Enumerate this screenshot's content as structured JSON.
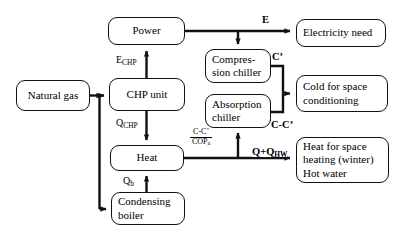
{
  "diagram": {
    "nodes": [
      {
        "id": "natural-gas",
        "label": "Natural gas",
        "x": 16,
        "y": 80,
        "w": 74,
        "h": 31,
        "align": "center"
      },
      {
        "id": "power",
        "label": "Power",
        "x": 108,
        "y": 17,
        "w": 77,
        "h": 28,
        "align": "center"
      },
      {
        "id": "chp-unit",
        "label": "CHP unit",
        "x": 109,
        "y": 78,
        "w": 76,
        "h": 33,
        "align": "center"
      },
      {
        "id": "heat",
        "label": "Heat",
        "x": 110,
        "y": 145,
        "w": 74,
        "h": 26,
        "align": "center"
      },
      {
        "id": "condensing-boiler",
        "label": "Condensing boiler",
        "x": 111,
        "y": 192,
        "w": 74,
        "h": 33,
        "align": "left"
      },
      {
        "id": "compression-chiller",
        "label": "Compres-sion chiller",
        "x": 205,
        "y": 49,
        "w": 66,
        "h": 34,
        "align": "left"
      },
      {
        "id": "absorption-chiller",
        "label": "Absorption chiller",
        "x": 205,
        "y": 94,
        "w": 66,
        "h": 34,
        "align": "left"
      },
      {
        "id": "electricity-need",
        "label": "Electricity need",
        "x": 296,
        "y": 19,
        "w": 90,
        "h": 28,
        "align": "left"
      },
      {
        "id": "cold-for-space",
        "label": "Cold for space conditioning",
        "x": 296,
        "y": 75,
        "w": 92,
        "h": 37,
        "align": "left"
      },
      {
        "id": "heat-for-space",
        "label": "Heat for space heating (winter) Hot water",
        "x": 296,
        "y": 137,
        "w": 93,
        "h": 46,
        "align": "left"
      }
    ],
    "labels": {
      "e_chp": {
        "text": "E",
        "sub": "CHP"
      },
      "q_chp": {
        "text": "Q",
        "sub": "CHP"
      },
      "q_b": {
        "text": "Q",
        "sub": "b"
      },
      "e": {
        "text": "E"
      },
      "c_prime": {
        "text": "C’"
      },
      "c_minus_c_prime": {
        "text": "C-C’"
      },
      "q_plus_qhw": {
        "text": "Q+Q",
        "sub": "HW"
      },
      "cop_fraction": {
        "numerator": "C-C’",
        "denominator": "COP",
        "denominator_sub": "a"
      }
    },
    "colors": {
      "stroke": "#111111",
      "background": "#ffffff",
      "text": "#000000"
    }
  }
}
